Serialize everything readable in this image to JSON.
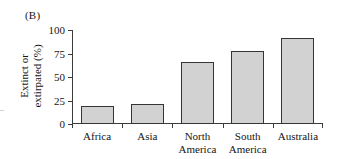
{
  "figure": {
    "panel_label": "(B)",
    "ylabel_line1": "Extinct or",
    "ylabel_line2": "extirpated (%)",
    "bar_fill_color": "#d2d2d2",
    "bar_border_color": "#353535",
    "axis_color": "#3b3b3b"
  },
  "chart_data": {
    "type": "bar",
    "title": "",
    "xlabel": "",
    "ylabel": "Extinct or extirpated (%)",
    "categories": [
      "Africa",
      "Asia",
      "North America",
      "South America",
      "Australia"
    ],
    "category_lines": [
      [
        "Africa"
      ],
      [
        "Asia"
      ],
      [
        "North",
        "America"
      ],
      [
        "South",
        "America"
      ],
      [
        "Australia"
      ]
    ],
    "values": [
      19,
      21,
      66,
      78,
      91
    ],
    "ylim": [
      0,
      100
    ],
    "yticks": [
      0,
      25,
      50,
      75,
      100
    ],
    "ytick_labels": [
      "0",
      "25",
      "50",
      "75",
      "100"
    ],
    "grid": false,
    "legend": false
  }
}
